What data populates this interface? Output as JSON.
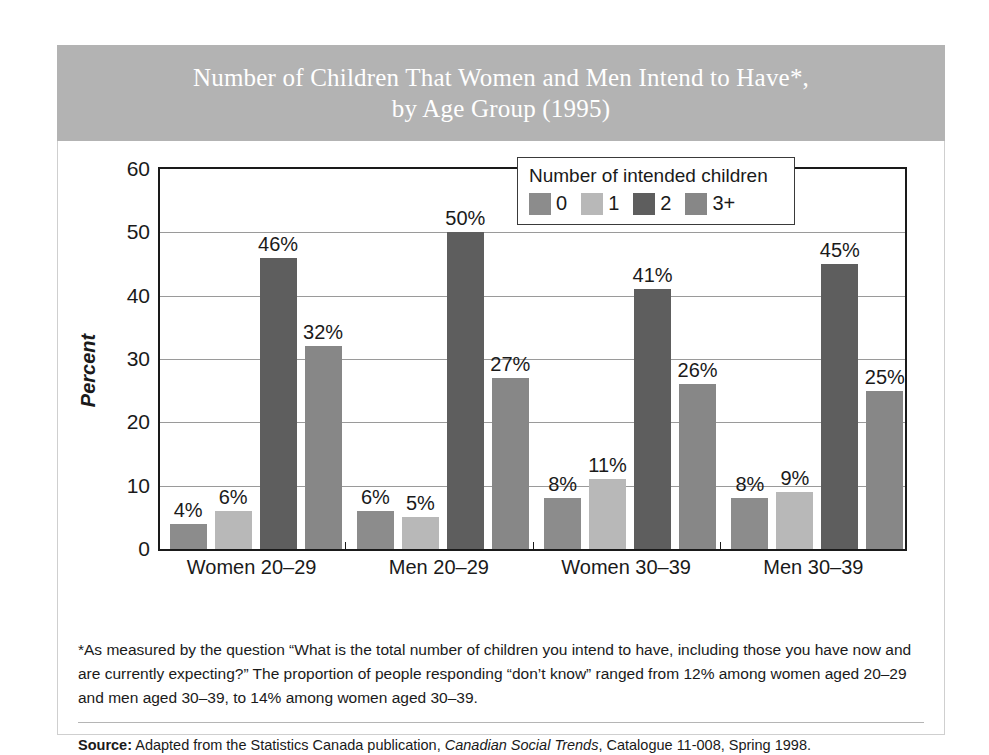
{
  "title": {
    "line1": "Number of Children That Women and Men Intend to Have*,",
    "line2": "by Age Group (1995)"
  },
  "legend": {
    "title": "Number of intended children",
    "items": [
      {
        "label": "0",
        "color": "#8c8c8c"
      },
      {
        "label": "1",
        "color": "#b8b8b8"
      },
      {
        "label": "2",
        "color": "#5e5e5e"
      },
      {
        "label": "3+",
        "color": "#878787"
      }
    ]
  },
  "footnote": "*As measured by the question “What is the total number of children you intend to have, including those you have now and are currently expecting?” The proportion of people responding “don’t know” ranged from 12% among women aged 20–29 and men aged 30–39, to 14% among women aged 30–39.",
  "source": {
    "label": "Source:",
    "text_before": " Adapted from the Statistics Canada publication, ",
    "publication": "Canadian Social Trends",
    "text_after": ", Catalogue 11-008, Spring 1998."
  },
  "chart_data": {
    "type": "bar",
    "title": "Number of Children That Women and Men Intend to Have*, by Age Group (1995)",
    "xlabel": "",
    "ylabel": "Percent",
    "ylim": [
      0,
      60
    ],
    "yticks": [
      0,
      10,
      20,
      30,
      40,
      50,
      60
    ],
    "ytick_labels": [
      "0",
      "10",
      "20",
      "30",
      "40",
      "50",
      "60"
    ],
    "grid": true,
    "legend_position": "inside-top-right",
    "legend_title": "Number of intended children",
    "categories": [
      "Women 20–29",
      "Men 20–29",
      "Women 30–39",
      "Men 30–39"
    ],
    "series": [
      {
        "name": "0",
        "color": "#8c8c8c",
        "values": [
          4,
          6,
          8,
          8
        ],
        "labels": [
          "4%",
          "6%",
          "8%",
          "8%"
        ]
      },
      {
        "name": "1",
        "color": "#b8b8b8",
        "values": [
          6,
          5,
          11,
          9
        ],
        "labels": [
          "6%",
          "5%",
          "11%",
          "9%"
        ]
      },
      {
        "name": "2",
        "color": "#5e5e5e",
        "values": [
          46,
          50,
          41,
          45
        ],
        "labels": [
          "46%",
          "50%",
          "41%",
          "45%"
        ]
      },
      {
        "name": "3+",
        "color": "#878787",
        "values": [
          32,
          27,
          26,
          25
        ],
        "labels": [
          "32%",
          "27%",
          "26%",
          "25%"
        ]
      }
    ]
  }
}
